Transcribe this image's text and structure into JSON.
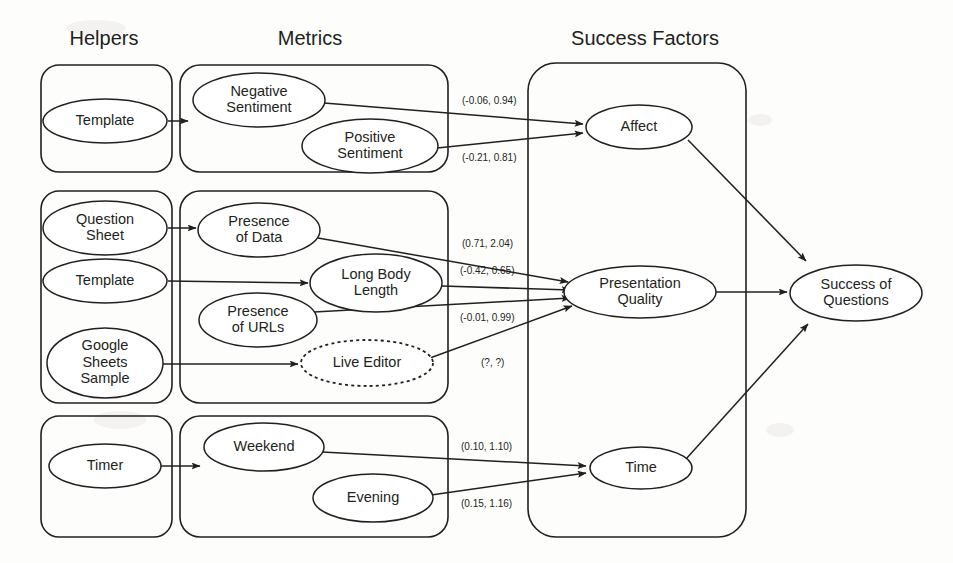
{
  "diagram": {
    "stroke_color": "#231f20",
    "background": "#fdfdfc",
    "headers": [
      {
        "id": "helpers",
        "label": "Helpers",
        "x": 104,
        "y": 40
      },
      {
        "id": "metrics",
        "label": "Metrics",
        "x": 310,
        "y": 40
      },
      {
        "id": "success-factors",
        "label": "Success Factors",
        "x": 645,
        "y": 40
      }
    ],
    "groups": [
      {
        "id": "helpers-affect",
        "column": "helpers",
        "x": 41,
        "y": 65,
        "w": 131,
        "h": 107,
        "r": 18
      },
      {
        "id": "helpers-presentation",
        "column": "helpers",
        "x": 41,
        "y": 191,
        "w": 131,
        "h": 212,
        "r": 18
      },
      {
        "id": "helpers-time",
        "column": "helpers",
        "x": 41,
        "y": 416,
        "w": 131,
        "h": 121,
        "r": 18
      },
      {
        "id": "metrics-affect",
        "column": "metrics",
        "x": 180,
        "y": 65,
        "w": 268,
        "h": 107,
        "r": 20
      },
      {
        "id": "metrics-presentation",
        "column": "metrics",
        "x": 180,
        "y": 191,
        "w": 268,
        "h": 212,
        "r": 20
      },
      {
        "id": "metrics-time",
        "column": "metrics",
        "x": 180,
        "y": 416,
        "w": 268,
        "h": 121,
        "r": 20
      },
      {
        "id": "success-factors-box",
        "column": "success",
        "x": 528,
        "y": 63,
        "w": 218,
        "h": 474,
        "r": 28
      }
    ],
    "nodes": [
      {
        "id": "template-1",
        "label": "Template",
        "lines": [
          "Template"
        ],
        "cx": 105,
        "cy": 121,
        "rx": 62,
        "ry": 22,
        "style": "solid",
        "column": "helpers"
      },
      {
        "id": "question-sheet",
        "label": "Question Sheet",
        "lines": [
          "Question",
          "Sheet"
        ],
        "cx": 105,
        "cy": 228,
        "rx": 62,
        "ry": 27,
        "style": "solid",
        "column": "helpers"
      },
      {
        "id": "template-2",
        "label": "Template",
        "lines": [
          "Template"
        ],
        "cx": 105,
        "cy": 281,
        "rx": 62,
        "ry": 22,
        "style": "solid",
        "column": "helpers"
      },
      {
        "id": "google-sheets",
        "label": "Google Sheets Sample",
        "lines": [
          "Google",
          "Sheets",
          "Sample"
        ],
        "cx": 105,
        "cy": 363,
        "rx": 58,
        "ry": 35,
        "style": "solid",
        "column": "helpers"
      },
      {
        "id": "timer",
        "label": "Timer",
        "lines": [
          "Timer"
        ],
        "cx": 105,
        "cy": 466,
        "rx": 56,
        "ry": 22,
        "style": "solid",
        "column": "helpers"
      },
      {
        "id": "negative-sentiment",
        "label": "Negative Sentiment",
        "lines": [
          "Negative",
          "Sentiment"
        ],
        "cx": 259,
        "cy": 100,
        "rx": 66,
        "ry": 27,
        "style": "solid",
        "column": "metrics"
      },
      {
        "id": "positive-sentiment",
        "label": "Positive Sentiment",
        "lines": [
          "Positive",
          "Sentiment"
        ],
        "cx": 370,
        "cy": 146,
        "rx": 68,
        "ry": 27,
        "style": "solid",
        "column": "metrics"
      },
      {
        "id": "presence-of-data",
        "label": "Presence of Data",
        "lines": [
          "Presence",
          "of Data"
        ],
        "cx": 259,
        "cy": 230,
        "rx": 61,
        "ry": 27,
        "style": "solid",
        "column": "metrics"
      },
      {
        "id": "long-body-length",
        "label": "Long Body Length",
        "lines": [
          "Long Body",
          "Length"
        ],
        "cx": 376,
        "cy": 283,
        "rx": 66,
        "ry": 29,
        "style": "solid",
        "column": "metrics"
      },
      {
        "id": "presence-of-urls",
        "label": "Presence of URLs",
        "lines": [
          "Presence",
          "of URLs"
        ],
        "cx": 258,
        "cy": 320,
        "rx": 59,
        "ry": 27,
        "style": "solid",
        "column": "metrics"
      },
      {
        "id": "live-editor",
        "label": "Live Editor",
        "lines": [
          "Live Editor"
        ],
        "cx": 367,
        "cy": 363,
        "rx": 66,
        "ry": 23,
        "style": "dashed",
        "column": "metrics"
      },
      {
        "id": "weekend",
        "label": "Weekend",
        "lines": [
          "Weekend"
        ],
        "cx": 264,
        "cy": 447,
        "rx": 60,
        "ry": 24,
        "style": "solid",
        "column": "metrics"
      },
      {
        "id": "evening",
        "label": "Evening",
        "lines": [
          "Evening"
        ],
        "cx": 373,
        "cy": 498,
        "rx": 60,
        "ry": 24,
        "style": "solid",
        "column": "metrics"
      },
      {
        "id": "affect",
        "label": "Affect",
        "lines": [
          "Affect"
        ],
        "cx": 639,
        "cy": 127,
        "rx": 53,
        "ry": 22,
        "style": "solid",
        "column": "success"
      },
      {
        "id": "presentation-quality",
        "label": "Presentation Quality",
        "lines": [
          "Presentation",
          "Quality"
        ],
        "cx": 640,
        "cy": 292,
        "rx": 76,
        "ry": 26,
        "style": "solid",
        "column": "success"
      },
      {
        "id": "time",
        "label": "Time",
        "lines": [
          "Time"
        ],
        "cx": 641,
        "cy": 468,
        "rx": 51,
        "ry": 21,
        "style": "solid",
        "column": "success"
      },
      {
        "id": "success-of-questions",
        "label": "Success of Questions",
        "lines": [
          "Success of",
          "Questions"
        ],
        "cx": 856,
        "cy": 293,
        "rx": 66,
        "ry": 28,
        "style": "solid",
        "column": "outcome"
      }
    ],
    "edges": [
      {
        "id": "e-template1-negative",
        "from": "template-1",
        "to": "negative-sentiment",
        "arrow": true,
        "path": "M 168 121 L 188 121"
      },
      {
        "id": "e-negative-affect",
        "from": "negative-sentiment",
        "to": "affect",
        "arrow": true,
        "path": "M 324 103 L 583 124"
      },
      {
        "id": "e-positive-affect",
        "from": "positive-sentiment",
        "to": "affect",
        "arrow": true,
        "path": "M 437 148 L 583 133"
      },
      {
        "id": "e-qsheet-presdata",
        "from": "question-sheet",
        "to": "presence-of-data",
        "arrow": true,
        "path": "M 168 228 L 196 228"
      },
      {
        "id": "e-template2-longbody",
        "from": "template-2",
        "to": "long-body-length",
        "arrow": true,
        "path": "M 168 281 L 308 283"
      },
      {
        "id": "e-gsheets-liveeditor",
        "from": "google-sheets",
        "to": "live-editor",
        "arrow": true,
        "path": "M 163 364 L 298 364"
      },
      {
        "id": "e-presdata-presquality",
        "from": "presence-of-data",
        "to": "presentation-quality",
        "arrow": true,
        "path": "M 318 238 L 568 282"
      },
      {
        "id": "e-longbody-presquality",
        "from": "long-body-length",
        "to": "presentation-quality",
        "arrow": true,
        "path": "M 442 286 L 570 290"
      },
      {
        "id": "e-presurls-presquality",
        "from": "presence-of-urls",
        "to": "presentation-quality",
        "arrow": true,
        "path": "M 314 312 L 570 298"
      },
      {
        "id": "e-liveeditor-presquality",
        "from": "live-editor",
        "to": "presentation-quality",
        "arrow": true,
        "path": "M 430 358 L 572 306"
      },
      {
        "id": "e-timer-weekend",
        "from": "timer",
        "to": "weekend",
        "arrow": true,
        "path": "M 161 466 L 200 466"
      },
      {
        "id": "e-weekend-time",
        "from": "weekend",
        "to": "time",
        "arrow": true,
        "path": "M 322 452 L 586 466"
      },
      {
        "id": "e-evening-time",
        "from": "evening",
        "to": "time",
        "arrow": true,
        "path": "M 431 495 L 586 473"
      },
      {
        "id": "e-affect-success",
        "from": "affect",
        "to": "success-of-questions",
        "arrow": true,
        "path": "M 688 140 L 806 261"
      },
      {
        "id": "e-presquality-success",
        "from": "presentation-quality",
        "to": "success-of-questions",
        "arrow": true,
        "path": "M 716 292 L 787 292"
      },
      {
        "id": "e-time-success",
        "from": "time",
        "to": "success-of-questions",
        "arrow": true,
        "path": "M 686 459 L 808 324"
      }
    ],
    "coefficients": [
      {
        "id": "coef-negative-affect",
        "edge": "e-negative-affect",
        "label": "(-0.06, 0.94)",
        "x": 462,
        "y": 101
      },
      {
        "id": "coef-positive-affect",
        "edge": "e-positive-affect",
        "label": "(-0.21, 0.81)",
        "x": 462,
        "y": 158
      },
      {
        "id": "coef-presdata-quality",
        "edge": "e-presdata-presquality",
        "label": "(0.71, 2.04)",
        "x": 462,
        "y": 244
      },
      {
        "id": "coef-longbody-quality",
        "edge": "e-longbody-presquality",
        "label": "(-0.42, 0.65)",
        "x": 460,
        "y": 271
      },
      {
        "id": "coef-presurls-quality",
        "edge": "e-presurls-presquality",
        "label": "(-0.01, 0.99)",
        "x": 460,
        "y": 318
      },
      {
        "id": "coef-liveeditor-quality",
        "edge": "e-liveeditor-presquality",
        "label": "(?, ?)",
        "x": 481,
        "y": 363
      },
      {
        "id": "coef-weekend-time",
        "edge": "e-weekend-time",
        "label": "(0.10, 1.10)",
        "x": 461,
        "y": 447
      },
      {
        "id": "coef-evening-time",
        "edge": "e-evening-time",
        "label": "(0.15, 1.16)",
        "x": 461,
        "y": 504
      }
    ]
  }
}
